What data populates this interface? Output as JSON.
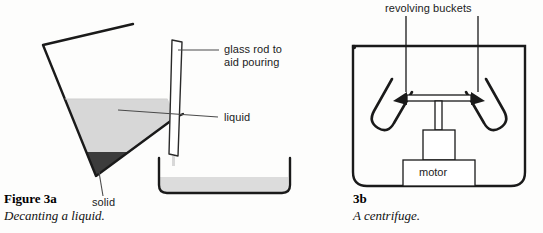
{
  "page": {
    "background_color": "#fdfdfc",
    "ink_color": "#1a1a1a"
  },
  "figure_a": {
    "caption_title": "Figure 3a",
    "caption_subtitle": "Decanting a liquid.",
    "labels": {
      "glass_rod_line1": "glass rod to",
      "glass_rod_line2": "aid pouring",
      "liquid": "liquid",
      "solid": "solid"
    },
    "colors": {
      "liquid_fill": "#d7d7d7",
      "solid_fill": "#3c3c3c",
      "glass_outline": "#1a1a1a",
      "dish_liquid": "#dcdcdc"
    }
  },
  "figure_b": {
    "caption_title": "3b",
    "caption_subtitle": "A centrifuge.",
    "labels": {
      "revolving_buckets": "revolving buckets",
      "motor": "motor"
    },
    "colors": {
      "casing_outline": "#1a1a1a",
      "rotor_outline": "#1a1a1a",
      "bucket_outline": "#1a1a1a"
    }
  }
}
